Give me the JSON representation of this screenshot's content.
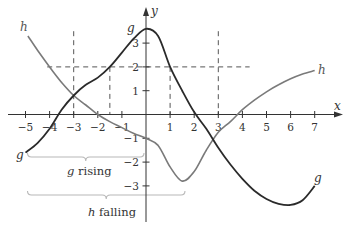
{
  "chart_data": {
    "type": "line",
    "title": "",
    "xlabel": "x",
    "ylabel": "y",
    "xlim": [
      -5.2,
      7.8
    ],
    "ylim": [
      -4.2,
      4.0
    ],
    "grid": false,
    "x_ticks": [
      -5,
      -4,
      -3,
      -2,
      -1,
      1,
      2,
      3,
      4,
      5,
      6,
      7
    ],
    "y_ticks": [
      -3,
      -2,
      -1,
      1,
      2,
      3
    ],
    "x_tick_labels": [
      "−5",
      "−4",
      "−3",
      "−2",
      "−1",
      "1",
      "2",
      "3",
      "4",
      "5",
      "6",
      "7"
    ],
    "y_tick_labels": [
      "−3",
      "−2",
      "−1",
      "1",
      "2",
      "3"
    ],
    "series": [
      {
        "name": "g",
        "color": "#2a2a2a",
        "x": [
          -5,
          -4.5,
          -4,
          -3.5,
          -3,
          -2.5,
          -2,
          -1.5,
          -1,
          -0.5,
          0,
          0.5,
          1,
          1.5,
          2,
          2.5,
          3,
          3.5,
          4,
          4.5,
          5,
          5.5,
          6,
          6.5,
          7
        ],
        "y": [
          -1.6,
          -1.2,
          -0.6,
          0.2,
          0.8,
          1.25,
          1.55,
          2.0,
          2.6,
          3.2,
          3.6,
          3.3,
          2.0,
          1.0,
          0.1,
          -0.6,
          -1.4,
          -2.1,
          -2.7,
          -3.2,
          -3.55,
          -3.75,
          -3.8,
          -3.6,
          -3.0
        ]
      },
      {
        "name": "h",
        "color": "#7a7a7a",
        "x": [
          -4.9,
          -4.5,
          -4,
          -3.5,
          -3,
          -2.5,
          -2,
          -1.5,
          -1,
          -0.5,
          0,
          0.5,
          1,
          1.5,
          2,
          2.5,
          3,
          3.5,
          4,
          4.5,
          5,
          5.5,
          6,
          6.5,
          7
        ],
        "y": [
          3.3,
          2.7,
          2.0,
          1.35,
          0.8,
          0.4,
          0.0,
          -0.3,
          -0.55,
          -0.8,
          -1.0,
          -1.3,
          -2.2,
          -2.8,
          -2.4,
          -1.5,
          -0.75,
          -0.3,
          0.2,
          0.6,
          0.95,
          1.25,
          1.5,
          1.7,
          1.85
        ]
      }
    ],
    "reference_lines": {
      "horizontal": [
        {
          "y": 2,
          "x_from": -4.1,
          "x_to": 4.3,
          "style": "dashed"
        }
      ],
      "vertical": [
        {
          "x": -3,
          "y_from": 3.5,
          "y_to": 0,
          "style": "dashed"
        },
        {
          "x": -1.5,
          "y_from": 2,
          "y_to": 0,
          "style": "dashed"
        },
        {
          "x": 1,
          "y_from": 2,
          "y_to": 0,
          "style": "dashed"
        },
        {
          "x": 3,
          "y_from": 3.5,
          "y_to": 0,
          "style": "dashed"
        }
      ]
    },
    "annotations": [
      {
        "text": "g rising",
        "type": "brace",
        "x_from": -5,
        "x_to": 0
      },
      {
        "text": "h falling",
        "type": "brace",
        "x_from": -5,
        "x_to": 1.7
      }
    ],
    "curve_labels": [
      {
        "series": "h",
        "position": "start"
      },
      {
        "series": "h",
        "position": "end"
      },
      {
        "series": "g",
        "position": "start"
      },
      {
        "series": "g",
        "position": "peak"
      },
      {
        "series": "g",
        "position": "end"
      }
    ]
  },
  "labels": {
    "x_axis": "x",
    "y_axis": "y",
    "g": "g",
    "h": "h",
    "g_rising_var": "g",
    "g_rising_word": "rising",
    "h_falling_var": "h",
    "h_falling_word": "falling"
  },
  "colors": {
    "g_curve": "#2a2a2a",
    "h_curve": "#7a7a7a",
    "axis": "#333333",
    "dashed": "#555555",
    "brace": "#b8b8b8"
  }
}
